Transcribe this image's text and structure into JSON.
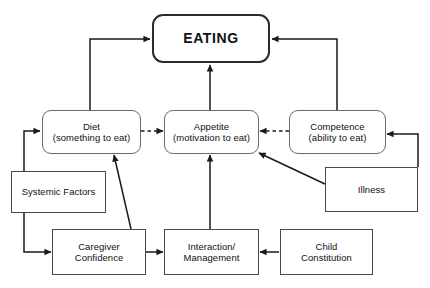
{
  "diagram": {
    "title": "EATING",
    "canvas": {
      "width": 430,
      "height": 288,
      "background": "#ffffff"
    },
    "nodes": {
      "eating": {
        "label": "EATING"
      },
      "diet": {
        "label": "Diet\n(something to eat)"
      },
      "appetite": {
        "label": "Appetite\n(motivation to eat)"
      },
      "competence": {
        "label": "Competence\n(ability to eat)"
      },
      "systemic_factors": {
        "label": "Systemic Factors"
      },
      "illness": {
        "label": "Illness"
      },
      "caregiver_confidence": {
        "label": "Caregiver\nConfidence"
      },
      "interaction_management": {
        "label": "Interaction/\nManagement"
      },
      "child_constitution": {
        "label": "Child\nConstitution"
      }
    },
    "colors": {
      "stroke": "#4a4a4a",
      "stroke_hero": "#2b2b2b",
      "edge": "#1a1a1a",
      "text": "#111111",
      "background": "#ffffff"
    },
    "edges": [
      {
        "from": "diet",
        "to": "eating",
        "style": "solid",
        "routing": "elbow-up-right"
      },
      {
        "from": "competence",
        "to": "eating",
        "style": "solid",
        "routing": "elbow-up-left"
      },
      {
        "from": "appetite",
        "to": "eating",
        "style": "solid",
        "routing": "straight-up"
      },
      {
        "from": "diet",
        "to": "appetite",
        "style": "dashed",
        "routing": "straight-right"
      },
      {
        "from": "competence",
        "to": "appetite",
        "style": "dashed",
        "routing": "straight-left"
      },
      {
        "from": "systemic_factors",
        "to": "diet",
        "style": "solid",
        "routing": "elbow-left-up"
      },
      {
        "from": "systemic_factors",
        "to": "caregiver_confidence",
        "style": "solid",
        "routing": "elbow-left-down"
      },
      {
        "from": "caregiver_confidence",
        "to": "diet",
        "style": "solid",
        "routing": "diagonal-up"
      },
      {
        "from": "caregiver_confidence",
        "to": "interaction_management",
        "style": "solid",
        "routing": "straight-right"
      },
      {
        "from": "interaction_management",
        "to": "appetite",
        "style": "solid",
        "routing": "straight-up"
      },
      {
        "from": "child_constitution",
        "to": "interaction_management",
        "style": "solid",
        "routing": "straight-left"
      },
      {
        "from": "illness",
        "to": "appetite",
        "style": "solid",
        "routing": "diagonal-up-left"
      },
      {
        "from": "illness",
        "to": "competence",
        "style": "solid",
        "routing": "elbow-right-up"
      }
    ]
  }
}
